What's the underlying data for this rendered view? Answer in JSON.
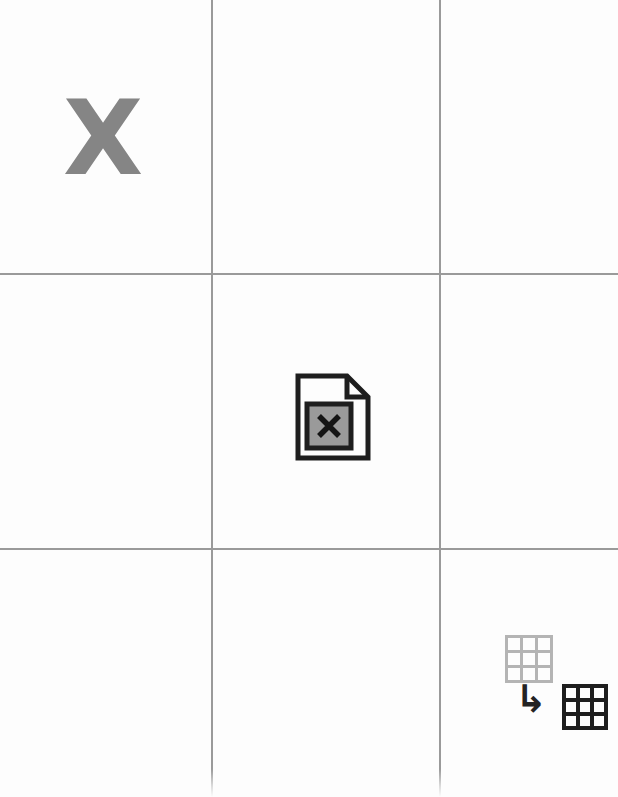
{
  "canvas": {
    "width": 618,
    "height": 797,
    "background_color": "#fdfdfd",
    "guide_color": "#9a9a9a"
  },
  "grid": {
    "columns": 3,
    "rows": 3,
    "vertical_lines_x": [
      211,
      439
    ],
    "horizontal_lines_y": [
      273,
      548
    ]
  },
  "cells": {
    "top_left": {
      "name": "letter-cell",
      "letter": "X",
      "letter_color": "#858585"
    },
    "center": {
      "name": "document-cell",
      "icon": "document-with-x-icon",
      "icon_outline_color": "#1e1e1e",
      "icon_fill_color": "#9a9a9a",
      "inner_symbol": "X"
    },
    "bottom_right": {
      "name": "transform-cell",
      "source_grid_icon": "grid-3x3-light-icon",
      "source_grid_color": "#b4b4b4",
      "arrow_icon": "arrow-down-right-icon",
      "arrow_glyph": "↳",
      "arrow_color": "#232323",
      "target_grid_icon": "grid-3x3-dark-icon",
      "target_grid_color": "#1e1e1e"
    }
  }
}
